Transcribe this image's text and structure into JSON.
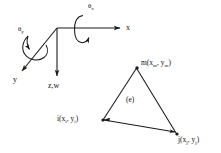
{
  "figure": {
    "kind": "engineering-diagram",
    "stroke_color": "#1a1a1a",
    "background_color": "#ffffff"
  },
  "axes": {
    "origin": {
      "x": 57,
      "y": 28
    },
    "items": [
      {
        "name": "x-axis",
        "label": "x",
        "label_pos": {
          "x": 126,
          "y": 25
        },
        "from": {
          "x": 57,
          "y": 28
        },
        "to": {
          "x": 121,
          "y": 28
        },
        "arrow": true
      },
      {
        "name": "y-axis",
        "label": "y",
        "label_pos": {
          "x": 13,
          "y": 78
        },
        "from": {
          "x": 57,
          "y": 28
        },
        "to": {
          "x": 21,
          "y": 72
        },
        "arrow": true
      },
      {
        "name": "z-w-axis",
        "label": "z,w",
        "label_pos": {
          "x": 49,
          "y": 84
        },
        "from": {
          "x": 57,
          "y": 28
        },
        "to": {
          "x": 57,
          "y": 77
        },
        "arrow": true
      }
    ]
  },
  "rotations": [
    {
      "name": "theta-x",
      "symbol": "θ",
      "subscript": "x",
      "label_pos": {
        "x": 88,
        "y": 4
      },
      "center": {
        "x": 82,
        "y": 29
      },
      "rx": 7,
      "ry": 14
    },
    {
      "name": "theta-y",
      "symbol": "θ",
      "subscript": "y",
      "label_pos": {
        "x": 18,
        "y": 27
      },
      "center": {
        "x": 35,
        "y": 49
      },
      "rx": 13,
      "ry": 8,
      "rotation_deg": -50
    }
  ],
  "element": {
    "label": "(e)",
    "label_pos": {
      "x": 126,
      "y": 98
    },
    "nodes": [
      {
        "id": "m",
        "label": "m(x",
        "sub1": "m",
        "mid": ", y",
        "sub2": "m",
        "close": ")",
        "point": {
          "x": 137,
          "y": 68
        },
        "label_pos": {
          "x": 141,
          "y": 62
        }
      },
      {
        "id": "i",
        "label": "i(x",
        "sub1": "i",
        "mid": ", y",
        "sub2": "i",
        "close": ")",
        "point": {
          "x": 103,
          "y": 120
        },
        "label_pos": {
          "x": 58,
          "y": 118
        }
      },
      {
        "id": "j",
        "label": "j(x",
        "sub1": "j",
        "mid": ", y",
        "sub2": "j",
        "close": ")",
        "point": {
          "x": 177,
          "y": 134
        },
        "label_pos": {
          "x": 177,
          "y": 136
        }
      }
    ],
    "edges": [
      {
        "name": "edge-i-m",
        "from": "i",
        "to": "m"
      },
      {
        "name": "edge-m-j",
        "from": "m",
        "to": "j"
      },
      {
        "name": "edge-i-j",
        "from": "i",
        "to": "j",
        "arrow": true
      }
    ]
  }
}
